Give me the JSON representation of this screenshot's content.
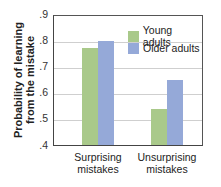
{
  "chart_data": {
    "type": "bar",
    "title": "",
    "xlabel": "",
    "ylabel": "Probability of learning from the mistake",
    "ylabel_lines": [
      "Probability of learning",
      "from the mistake"
    ],
    "categories": [
      "Surprising mistakes",
      "Unsurprising mistakes"
    ],
    "category_lines": [
      [
        "Surprising",
        "mistakes"
      ],
      [
        "Unsurprising",
        "mistakes"
      ]
    ],
    "series": [
      {
        "name": "Young adults",
        "color": "#a9c98a",
        "values": [
          0.775,
          0.54
        ]
      },
      {
        "name": "Older adults",
        "color": "#95a9d8",
        "values": [
          0.805,
          0.652
        ]
      }
    ],
    "ylim": [
      0.4,
      0.9
    ],
    "yticks": [
      ".4",
      ".5",
      ".6",
      ".7",
      ".8",
      ".9"
    ],
    "grid": true,
    "legend_position": "upper right inside"
  }
}
